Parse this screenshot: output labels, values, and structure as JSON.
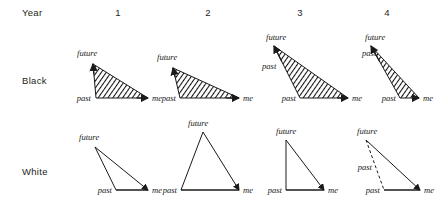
{
  "figure": {
    "row_labels": [
      {
        "name": "year",
        "text": "Year",
        "x": 22,
        "y": 14
      },
      {
        "name": "black",
        "text": "Black",
        "x": 22,
        "y": 82
      },
      {
        "name": "white",
        "text": "White",
        "x": 22,
        "y": 173
      }
    ],
    "column_numbers": [
      {
        "text": "1",
        "x": 118,
        "y": 14
      },
      {
        "text": "2",
        "x": 208,
        "y": 14
      },
      {
        "text": "3",
        "x": 300,
        "y": 14
      },
      {
        "text": "4",
        "x": 387,
        "y": 14
      }
    ],
    "vertex_terms": {
      "future": "future",
      "past": "past",
      "me": "me"
    },
    "hatch_color": "#111111",
    "line_color": "#1a1a1a",
    "background": "#ffffff",
    "panels": [
      {
        "name": "black-year-1",
        "row": "Black",
        "column": "1",
        "fill": "hatched",
        "future": {
          "x": 93,
          "y": 64
        },
        "past": {
          "x": 96,
          "y": 98
        },
        "me": {
          "x": 148,
          "y": 98
        },
        "labels": [
          {
            "text": "future",
            "x": 77,
            "y": 56,
            "anchor": "start"
          },
          {
            "text": "past",
            "x": 91,
            "y": 101,
            "anchor": "end"
          },
          {
            "text": "me",
            "x": 152,
            "y": 101,
            "anchor": "start"
          }
        ]
      },
      {
        "name": "black-year-2",
        "row": "Black",
        "column": "2",
        "fill": "hatched",
        "future": {
          "x": 173,
          "y": 68
        },
        "past": {
          "x": 180,
          "y": 98
        },
        "me": {
          "x": 239,
          "y": 98
        },
        "labels": [
          {
            "text": "future",
            "x": 157,
            "y": 60,
            "anchor": "start"
          },
          {
            "text": "past",
            "x": 176,
            "y": 101,
            "anchor": "end"
          },
          {
            "text": "me",
            "x": 243,
            "y": 101,
            "anchor": "start"
          }
        ]
      },
      {
        "name": "black-year-3",
        "row": "Black",
        "column": "3",
        "fill": "hatched",
        "future": {
          "x": 274,
          "y": 46
        },
        "past": {
          "x": 300,
          "y": 98
        },
        "me": {
          "x": 348,
          "y": 98
        },
        "labels": [
          {
            "text": "future",
            "x": 266,
            "y": 40,
            "anchor": "start"
          },
          {
            "text": "past",
            "x": 262,
            "y": 69,
            "anchor": "start"
          },
          {
            "text": "past",
            "x": 296,
            "y": 101,
            "anchor": "end"
          },
          {
            "text": "me",
            "x": 352,
            "y": 101,
            "anchor": "start"
          }
        ]
      },
      {
        "name": "black-year-4",
        "row": "Black",
        "column": "4",
        "fill": "hatched",
        "future": {
          "x": 371,
          "y": 46
        },
        "past": {
          "x": 400,
          "y": 98
        },
        "me": {
          "x": 419,
          "y": 98
        },
        "labels": [
          {
            "text": "future",
            "x": 365,
            "y": 40,
            "anchor": "start"
          },
          {
            "text": "past",
            "x": 362,
            "y": 56,
            "anchor": "start"
          },
          {
            "text": "past",
            "x": 396,
            "y": 101,
            "anchor": "end"
          },
          {
            "text": "me",
            "x": 423,
            "y": 101,
            "anchor": "start"
          }
        ]
      },
      {
        "name": "white-year-1",
        "row": "White",
        "column": "1",
        "fill": "open",
        "future": {
          "x": 95,
          "y": 147
        },
        "past": {
          "x": 116,
          "y": 190
        },
        "me": {
          "x": 148,
          "y": 190
        },
        "labels": [
          {
            "text": "future",
            "x": 79,
            "y": 140,
            "anchor": "start"
          },
          {
            "text": "past",
            "x": 112,
            "y": 193,
            "anchor": "end"
          },
          {
            "text": "me",
            "x": 152,
            "y": 193,
            "anchor": "start"
          }
        ]
      },
      {
        "name": "white-year-2",
        "row": "White",
        "column": "2",
        "fill": "open",
        "future": {
          "x": 203,
          "y": 132
        },
        "past": {
          "x": 181,
          "y": 190
        },
        "me": {
          "x": 239,
          "y": 190
        },
        "labels": [
          {
            "text": "future",
            "x": 188,
            "y": 126,
            "anchor": "start"
          },
          {
            "text": "past",
            "x": 177,
            "y": 193,
            "anchor": "end"
          },
          {
            "text": "me",
            "x": 243,
            "y": 193,
            "anchor": "start"
          }
        ]
      },
      {
        "name": "white-year-3",
        "row": "White",
        "column": "3",
        "fill": "open",
        "future": {
          "x": 286,
          "y": 140
        },
        "past": {
          "x": 286,
          "y": 190
        },
        "me": {
          "x": 324,
          "y": 190
        },
        "labels": [
          {
            "text": "future",
            "x": 276,
            "y": 134,
            "anchor": "start"
          },
          {
            "text": "past",
            "x": 282,
            "y": 193,
            "anchor": "end"
          },
          {
            "text": "me",
            "x": 328,
            "y": 193,
            "anchor": "start"
          }
        ]
      },
      {
        "name": "white-year-4",
        "row": "White",
        "column": "4",
        "fill": "open",
        "future": {
          "x": 366,
          "y": 140
        },
        "past": {
          "x": 384,
          "y": 190
        },
        "me": {
          "x": 420,
          "y": 190
        },
        "labels": [
          {
            "text": "future",
            "x": 357,
            "y": 134,
            "anchor": "start"
          },
          {
            "text": "past",
            "x": 372,
            "y": 170,
            "anchor": "end"
          },
          {
            "text": "past",
            "x": 380,
            "y": 193,
            "anchor": "end"
          },
          {
            "text": "me",
            "x": 424,
            "y": 193,
            "anchor": "start"
          }
        ]
      }
    ]
  }
}
